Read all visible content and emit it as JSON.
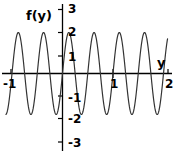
{
  "chart_data": {
    "type": "line",
    "title": "",
    "xlabel": "y",
    "ylabel": "f(y)",
    "xlim": [
      -1.12,
      2.08
    ],
    "ylim": [
      -3.2,
      3.1
    ],
    "grid": false,
    "legend": null,
    "curve": {
      "name": "f(y)",
      "amplitude": 2,
      "period": 0.5,
      "phase": 0,
      "expression": "2*sin(4*pi*y)",
      "color": "#333333",
      "linewidth": 1.2
    },
    "x_ticks": [
      {
        "value": -1,
        "label": "-1"
      },
      {
        "value": 1,
        "label": "1"
      },
      {
        "value": 2,
        "label": "2"
      }
    ],
    "y_ticks": [
      {
        "value": 3,
        "label": "3"
      },
      {
        "value": 2,
        "label": "2"
      },
      {
        "value": 1,
        "label": "1"
      },
      {
        "value": -1,
        "label": "-1"
      },
      {
        "value": -2,
        "label": "-2"
      },
      {
        "value": -3,
        "label": "-3"
      }
    ],
    "maxima": [
      {
        "x": -0.75,
        "y": 2
      },
      {
        "x": -0.25,
        "y": 2
      },
      {
        "x": 0.25,
        "y": 2
      },
      {
        "x": 0.75,
        "y": 2
      },
      {
        "x": 1.25,
        "y": 2
      },
      {
        "x": 1.75,
        "y": 2
      }
    ],
    "minima": [
      {
        "x": -0.5,
        "y": -2
      },
      {
        "x": 0.0,
        "y": -2
      },
      {
        "x": 0.5,
        "y": -2
      },
      {
        "x": 1.0,
        "y": -2
      },
      {
        "x": 1.5,
        "y": -2
      }
    ],
    "zero_crossings": [
      -1,
      -0.875,
      -0.625,
      -0.375,
      -0.125,
      0.125,
      0.375,
      0.625,
      0.875,
      1.125,
      1.375,
      1.625,
      1.875,
      2
    ]
  },
  "axes": {
    "x_axis_label": "y",
    "y_axis_label": "f(y)",
    "axis_color": "#000000"
  },
  "ticks": {
    "y3": "3",
    "y2": "2",
    "y1": "1",
    "ym1": "-1",
    "ym2": "-2",
    "ym3": "-3",
    "xm1": "-1",
    "x1": "1",
    "x2": "2"
  }
}
